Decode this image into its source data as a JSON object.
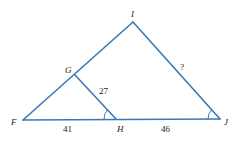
{
  "diagram": {
    "color": "#3a78b5",
    "vertices": {
      "F": {
        "label": "F",
        "x": 23,
        "y": 120
      },
      "G": {
        "label": "G",
        "x": 75,
        "y": 75
      },
      "H": {
        "label": "H",
        "x": 116,
        "y": 119
      },
      "I": {
        "label": "I",
        "x": 133,
        "y": 22
      },
      "J": {
        "label": "J",
        "x": 220,
        "y": 119
      }
    },
    "segments": {
      "FH": "41",
      "HJ": "46",
      "GH": "27",
      "IJ": "?"
    }
  }
}
